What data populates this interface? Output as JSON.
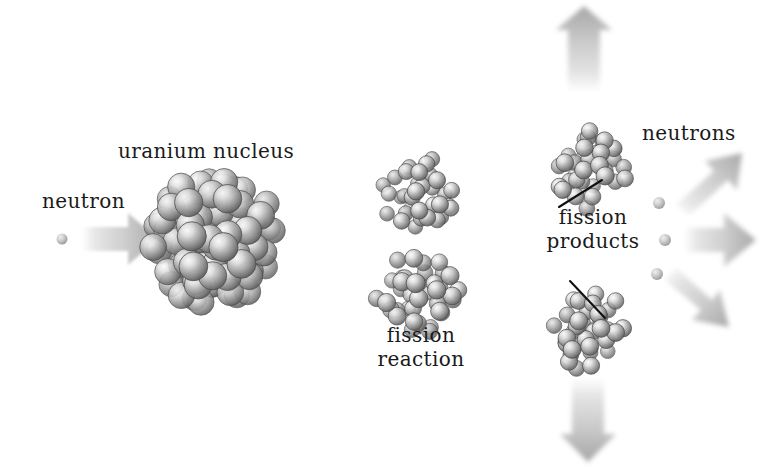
{
  "figure": {
    "domain": "diagram",
    "background_color": "#ffffff",
    "text_color": "#1a1a1a",
    "sphere_color_light": "#f2f2f2",
    "sphere_color_mid": "#9a9a9a",
    "sphere_color_dark": "#5d5d5d",
    "arrow_color": "#b9b9b9",
    "dashed_line_color": "#c9c9c9",
    "leader_line_color": "#111111"
  },
  "labels": {
    "neutron": "neutron",
    "uranium_nucleus": "uranium nucleus",
    "fission_reaction_line1": "fission",
    "fission_reaction_line2": "reaction",
    "fission_products_line1": "fission",
    "fission_products_line2": "products",
    "neutrons": "neutrons"
  },
  "elements": {
    "incoming_neutron": {
      "name": "incoming-neutron-dot",
      "cx": 62,
      "cy": 239,
      "r": 5
    },
    "incoming_arrow": {
      "name": "incoming-neutron-arrow",
      "direction": "right",
      "x": 80,
      "y": 215,
      "w": 75,
      "h": 48
    },
    "uranium_nucleus": {
      "name": "uranium-nucleus",
      "cx": 214,
      "cy": 240,
      "r": 72,
      "sphere_count": 92
    },
    "fission_reaction_top": {
      "name": "fission-reaction-top-fragment",
      "cx": 418,
      "cy": 192,
      "r": 43,
      "sphere_count": 34
    },
    "fission_reaction_bottom": {
      "name": "fission-reaction-bottom-fragment",
      "cx": 418,
      "cy": 295,
      "r": 47,
      "sphere_count": 38
    },
    "dashed_axis": {
      "name": "dashed-trajectory-line",
      "y": 238,
      "x_start": 292,
      "x_end": 600
    },
    "fission_product_top": {
      "name": "fission-product-top-nucleus",
      "cx": 590,
      "cy": 168,
      "r": 45,
      "sphere_count": 36
    },
    "fission_product_bottom": {
      "name": "fission-product-bottom-nucleus",
      "cx": 592,
      "cy": 334,
      "r": 45,
      "sphere_count": 36
    },
    "emitted_neutron_1": {
      "name": "emitted-neutron-dot-upper",
      "cx": 659,
      "cy": 203,
      "r": 6
    },
    "emitted_neutron_2": {
      "name": "emitted-neutron-dot-middle",
      "cx": 665,
      "cy": 240,
      "r": 6
    },
    "emitted_neutron_3": {
      "name": "emitted-neutron-dot-lower",
      "cx": 657,
      "cy": 274,
      "r": 6
    },
    "arrow_up": {
      "name": "energy-arrow-up",
      "direction": "up"
    },
    "arrow_up_right": {
      "name": "neutron-arrow-up-right",
      "direction": "up-right"
    },
    "arrow_right": {
      "name": "neutron-arrow-right",
      "direction": "right"
    },
    "arrow_down_right": {
      "name": "neutron-arrow-down-right",
      "direction": "down-right"
    },
    "arrow_down": {
      "name": "energy-arrow-down",
      "direction": "down"
    },
    "leader_to_top_product": {
      "name": "leader-line-top-product",
      "x1": 559,
      "y1": 207,
      "x2": 602,
      "y2": 180
    },
    "leader_to_bottom_product": {
      "name": "leader-line-bottom-product",
      "x1": 570,
      "y1": 281,
      "x2": 605,
      "y2": 318
    }
  },
  "label_positions": {
    "neutron": {
      "x": 42,
      "y": 190
    },
    "uranium_nucleus": {
      "x": 118,
      "y": 140
    },
    "fission_reaction": {
      "x": 366,
      "y": 324
    },
    "fission_products": {
      "x": 537,
      "y": 206
    },
    "neutrons": {
      "x": 642,
      "y": 122
    }
  }
}
